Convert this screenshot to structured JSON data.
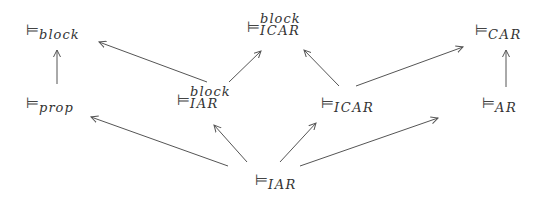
{
  "diagram": {
    "symbol": "⊨",
    "nodes": [
      {
        "id": "block",
        "sub": "block",
        "sup": ""
      },
      {
        "id": "prop",
        "sub": "prop",
        "sup": ""
      },
      {
        "id": "IAR_block",
        "sub": "IAR",
        "sup": "block"
      },
      {
        "id": "ICAR_block",
        "sub": "ICAR",
        "sup": "block"
      },
      {
        "id": "ICAR",
        "sub": "ICAR",
        "sup": ""
      },
      {
        "id": "CAR",
        "sub": "CAR",
        "sup": ""
      },
      {
        "id": "AR",
        "sub": "AR",
        "sup": ""
      },
      {
        "id": "IAR",
        "sub": "IAR",
        "sup": ""
      }
    ],
    "edges": [
      {
        "from": "prop",
        "to": "block"
      },
      {
        "from": "IAR_block",
        "to": "block"
      },
      {
        "from": "IAR_block",
        "to": "ICAR_block"
      },
      {
        "from": "ICAR",
        "to": "ICAR_block"
      },
      {
        "from": "ICAR",
        "to": "CAR"
      },
      {
        "from": "AR",
        "to": "CAR"
      },
      {
        "from": "IAR",
        "to": "prop"
      },
      {
        "from": "IAR",
        "to": "IAR_block"
      },
      {
        "from": "IAR",
        "to": "ICAR"
      },
      {
        "from": "IAR",
        "to": "AR"
      }
    ],
    "colors": {
      "line": "#555555",
      "text": "#333333"
    }
  }
}
